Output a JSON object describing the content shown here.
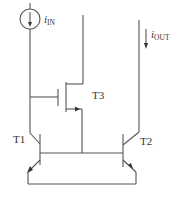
{
  "diagram": {
    "type": "circuit-schematic",
    "labels": {
      "input_current_symbol": "i",
      "input_current_subscript": "IN",
      "output_current_symbol": "i",
      "output_current_subscript": "OUT",
      "transistor_1": "T1",
      "transistor_2": "T2",
      "transistor_3": "T3"
    },
    "components": [
      {
        "id": "current-source",
        "kind": "current source",
        "label": "iIN",
        "direction": "down"
      },
      {
        "id": "T1",
        "kind": "npn BJT",
        "label": "T1"
      },
      {
        "id": "T2",
        "kind": "npn BJT",
        "label": "T2"
      },
      {
        "id": "T3",
        "kind": "n-channel MOSFET",
        "label": "T3"
      },
      {
        "id": "output-current",
        "kind": "current arrow",
        "label": "iOUT",
        "direction": "down"
      }
    ],
    "colors": {
      "line": "#555555",
      "text": "#333333",
      "background": "#ffffff"
    }
  }
}
